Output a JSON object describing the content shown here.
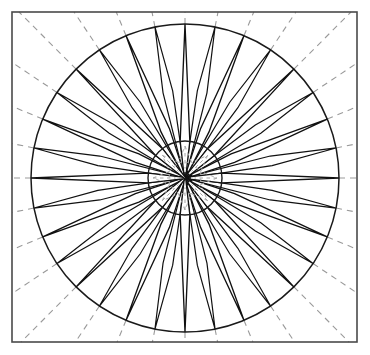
{
  "figure": {
    "kind": "line-drawing",
    "canvas": {
      "width": 370,
      "height": 355,
      "background": "#ffffff"
    }
  },
  "colors": {
    "background": "#ffffff",
    "frame_stroke": "#4a4a4a",
    "solid_stroke": "#111111",
    "dashed_stroke": "#9a9a9a",
    "fill": "#ffffff"
  },
  "geometry": {
    "frame": {
      "x": 12,
      "y": 12,
      "width": 345,
      "height": 330,
      "stroke_width": 1.6
    },
    "center": {
      "x": 185,
      "y": 178
    },
    "outer_circle_radius": 154,
    "inner_circle_radius": 37,
    "construction_rays": 32,
    "ray_angle_step_degrees": 11.25,
    "star_points_total": 32,
    "point_tiers": [
      {
        "name": "cardinal",
        "count": 4,
        "tip_radius": 154,
        "base_radius": 37,
        "half_width_degrees": 7.5
      },
      {
        "name": "intercardinal",
        "count": 4,
        "tip_radius": 154,
        "base_radius": 37,
        "half_width_degrees": 7.5
      },
      {
        "name": "secondary-intercardinal",
        "count": 8,
        "tip_radius": 154,
        "base_radius": 52,
        "half_width_degrees": 5.0
      },
      {
        "name": "by-point",
        "count": 16,
        "tip_radius": 154,
        "base_radius": 88,
        "half_width_degrees": 3.2
      }
    ],
    "inner_rosette": {
      "petals": 8,
      "outer_radius": 32,
      "inner_radius": 17
    }
  },
  "chart_data": {
    "type": "scatter",
    "xlabel": "",
    "ylabel": "",
    "categories": [
      "N",
      "NNE",
      "NE",
      "ENE",
      "E",
      "ESE",
      "SE",
      "SSE",
      "S",
      "SSW",
      "SW",
      "WSW",
      "W",
      "WNW",
      "NW",
      "NNW"
    ],
    "values": [
      154,
      154,
      154,
      154,
      154,
      154,
      154,
      154,
      154,
      154,
      154,
      154,
      154,
      154,
      154,
      154
    ],
    "series": [
      {
        "name": "major points (cardinal + intercardinal)",
        "directions_degrees": [
          0,
          45,
          90,
          135,
          180,
          225,
          270,
          315
        ],
        "tip_radius": 154,
        "base_radius": 37
      },
      {
        "name": "secondary points",
        "directions_degrees": [
          22.5,
          67.5,
          112.5,
          157.5,
          202.5,
          247.5,
          292.5,
          337.5
        ],
        "tip_radius": 154,
        "base_radius": 52
      },
      {
        "name": "minor points",
        "directions_degrees": [
          11.25,
          33.75,
          56.25,
          78.75,
          101.25,
          123.75,
          146.25,
          168.75,
          191.25,
          213.75,
          236.25,
          258.75,
          281.25,
          303.75,
          326.25,
          348.75
        ],
        "tip_radius": 154,
        "base_radius": 88
      }
    ],
    "axis_ranges": {
      "r": [
        0,
        154
      ],
      "theta": [
        0,
        360
      ]
    },
    "grid": true,
    "grid_style": "dashed radial construction lines, 32 rays at 11.25 degree spacing",
    "legend": "none",
    "annotations": []
  }
}
